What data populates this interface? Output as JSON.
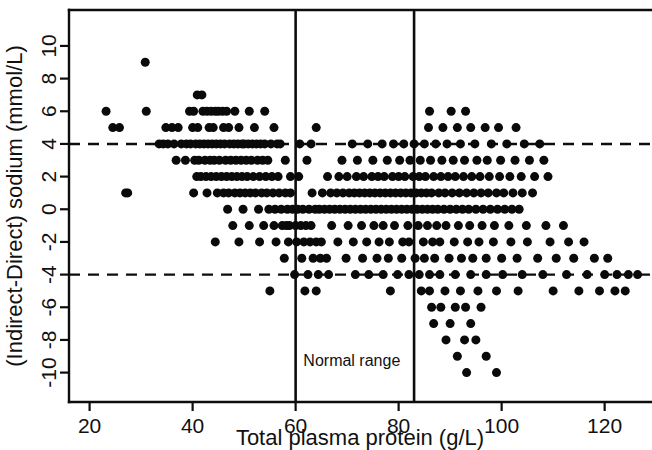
{
  "chart_data": {
    "type": "scatter",
    "title": "",
    "xlabel": "Total plasma protein (g/L)",
    "ylabel": "(Indirect-Direct) sodium (mmol/L)",
    "xlim": [
      16,
      129
    ],
    "ylim": [
      -11.8,
      12.2
    ],
    "xticks": [
      20,
      40,
      60,
      80,
      100,
      120
    ],
    "xtick_labels": [
      "20",
      "40",
      "60",
      "80",
      "100",
      "120"
    ],
    "yticks": [
      -10,
      -8,
      -6,
      -4,
      -2,
      0,
      2,
      4,
      6,
      8,
      10
    ],
    "ytick_labels": [
      "-10",
      "-8",
      "-6",
      "-4",
      "-2",
      "0",
      "2",
      "4",
      "6",
      "8",
      "10"
    ],
    "grid": false,
    "legend": "none",
    "marker": "filled-circle",
    "marker_color": "#0a0a0a",
    "marker_size_px": 9,
    "reference_lines": [
      {
        "name": "upper-limit-of-agreement",
        "orientation": "horizontal",
        "value": 4,
        "style": "dashed"
      },
      {
        "name": "lower-limit-of-agreement",
        "orientation": "horizontal",
        "value": -4,
        "style": "dashed"
      }
    ],
    "range_markers": [
      {
        "name": "normal-range-lower",
        "orientation": "vertical",
        "value": 60,
        "style": "solid"
      },
      {
        "name": "normal-range-upper",
        "orientation": "vertical",
        "value": 83,
        "style": "solid"
      }
    ],
    "annotations": [
      {
        "text": "Normal range",
        "x": 61.5,
        "y": -9.6
      }
    ],
    "points": [
      [
        23.2,
        6
      ],
      [
        24.5,
        5
      ],
      [
        25.8,
        5
      ],
      [
        27.0,
        1
      ],
      [
        30.8,
        9
      ],
      [
        31.0,
        6
      ],
      [
        33.5,
        4
      ],
      [
        34.3,
        4
      ],
      [
        34.8,
        5
      ],
      [
        36.0,
        5
      ],
      [
        37.2,
        5
      ],
      [
        35.2,
        4
      ],
      [
        36.4,
        4
      ],
      [
        37.8,
        4
      ],
      [
        38.8,
        4
      ],
      [
        39.4,
        6
      ],
      [
        40.2,
        6
      ],
      [
        40.9,
        7
      ],
      [
        41.8,
        7
      ],
      [
        40.0,
        5
      ],
      [
        41.0,
        5
      ],
      [
        39.6,
        4
      ],
      [
        40.6,
        4
      ],
      [
        41.4,
        4
      ],
      [
        42.2,
        4
      ],
      [
        43.0,
        4
      ],
      [
        42.0,
        6
      ],
      [
        42.8,
        6
      ],
      [
        43.6,
        6
      ],
      [
        44.4,
        6
      ],
      [
        43.2,
        5
      ],
      [
        44.0,
        5
      ],
      [
        43.8,
        4
      ],
      [
        44.6,
        4
      ],
      [
        45.4,
        4
      ],
      [
        46.2,
        4
      ],
      [
        45.0,
        6
      ],
      [
        45.8,
        6
      ],
      [
        46.6,
        6
      ],
      [
        46.0,
        5
      ],
      [
        47.0,
        5
      ],
      [
        47.2,
        4
      ],
      [
        48.0,
        4
      ],
      [
        48.8,
        4
      ],
      [
        49.6,
        4
      ],
      [
        48.2,
        6
      ],
      [
        49.0,
        5
      ],
      [
        50.0,
        4
      ],
      [
        50.8,
        4
      ],
      [
        51.6,
        4
      ],
      [
        52.4,
        4
      ],
      [
        51.0,
        6
      ],
      [
        52.0,
        5
      ],
      [
        53.2,
        4
      ],
      [
        54.0,
        4
      ],
      [
        55.2,
        4
      ],
      [
        56.4,
        4
      ],
      [
        38.6,
        3
      ],
      [
        40.4,
        3
      ],
      [
        41.2,
        3
      ],
      [
        42.4,
        3
      ],
      [
        43.4,
        3
      ],
      [
        44.2,
        3
      ],
      [
        45.2,
        3
      ],
      [
        46.4,
        3
      ],
      [
        47.4,
        3
      ],
      [
        48.4,
        3
      ],
      [
        49.4,
        3
      ],
      [
        50.4,
        3
      ],
      [
        51.4,
        3
      ],
      [
        52.6,
        3
      ],
      [
        53.6,
        3
      ],
      [
        54.6,
        3
      ],
      [
        36.8,
        3
      ],
      [
        40.8,
        2
      ],
      [
        41.6,
        2
      ],
      [
        42.6,
        2
      ],
      [
        43.6,
        2
      ],
      [
        44.6,
        2
      ],
      [
        45.6,
        2
      ],
      [
        46.6,
        2
      ],
      [
        47.6,
        2
      ],
      [
        48.6,
        2
      ],
      [
        49.6,
        2
      ],
      [
        50.6,
        2
      ],
      [
        51.8,
        2
      ],
      [
        53.0,
        2
      ],
      [
        54.2,
        2
      ],
      [
        55.4,
        2
      ],
      [
        56.6,
        2
      ],
      [
        40.2,
        1
      ],
      [
        42.8,
        1
      ],
      [
        44.8,
        1
      ],
      [
        46.0,
        1
      ],
      [
        47.0,
        1
      ],
      [
        48.2,
        1
      ],
      [
        49.2,
        1
      ],
      [
        50.2,
        1
      ],
      [
        51.2,
        1
      ],
      [
        52.2,
        1
      ],
      [
        53.4,
        1
      ],
      [
        54.4,
        1
      ],
      [
        55.6,
        1
      ],
      [
        56.8,
        1
      ],
      [
        58.0,
        1
      ],
      [
        59.0,
        1
      ],
      [
        27.4,
        1
      ],
      [
        46.8,
        0
      ],
      [
        49.8,
        0
      ],
      [
        52.8,
        0
      ],
      [
        54.8,
        0
      ],
      [
        56.0,
        0
      ],
      [
        57.2,
        0
      ],
      [
        58.4,
        0
      ],
      [
        59.4,
        0
      ],
      [
        60.4,
        0
      ],
      [
        61.4,
        0
      ],
      [
        47.8,
        -1
      ],
      [
        51.0,
        -1
      ],
      [
        53.8,
        -1
      ],
      [
        55.8,
        -1
      ],
      [
        57.4,
        -1
      ],
      [
        58.8,
        -1
      ],
      [
        60.0,
        -1
      ],
      [
        61.0,
        -1
      ],
      [
        62.0,
        -1
      ],
      [
        63.0,
        -1
      ],
      [
        44.4,
        -2
      ],
      [
        49.0,
        -2
      ],
      [
        53.0,
        -2
      ],
      [
        56.2,
        -2
      ],
      [
        58.6,
        -2
      ],
      [
        60.2,
        -2
      ],
      [
        61.6,
        -2
      ],
      [
        62.8,
        -2
      ],
      [
        64.0,
        -2
      ],
      [
        65.0,
        -2
      ],
      [
        57.8,
        -3
      ],
      [
        61.2,
        -3
      ],
      [
        63.4,
        -3
      ],
      [
        64.8,
        -3
      ],
      [
        66.0,
        -3
      ],
      [
        59.8,
        -4
      ],
      [
        62.4,
        -4
      ],
      [
        64.4,
        -4
      ],
      [
        66.4,
        -4
      ],
      [
        55.0,
        -5
      ],
      [
        61.8,
        -5
      ],
      [
        64.0,
        -5
      ],
      [
        58.2,
        -1
      ],
      [
        62.6,
        0
      ],
      [
        63.8,
        0
      ],
      [
        64.6,
        0
      ],
      [
        65.6,
        0
      ],
      [
        66.6,
        0
      ],
      [
        67.6,
        0
      ],
      [
        68.6,
        0
      ],
      [
        69.6,
        0
      ],
      [
        70.6,
        0
      ],
      [
        71.6,
        0
      ],
      [
        72.6,
        0
      ],
      [
        73.6,
        0
      ],
      [
        74.6,
        0
      ],
      [
        75.6,
        0
      ],
      [
        76.6,
        0
      ],
      [
        77.6,
        0
      ],
      [
        78.6,
        0
      ],
      [
        79.6,
        0
      ],
      [
        80.6,
        0
      ],
      [
        81.6,
        0
      ],
      [
        82.6,
        0
      ],
      [
        83.6,
        0
      ],
      [
        84.6,
        0
      ],
      [
        85.6,
        0
      ],
      [
        86.6,
        0
      ],
      [
        87.6,
        0
      ],
      [
        88.8,
        0
      ],
      [
        90.0,
        0
      ],
      [
        91.2,
        0
      ],
      [
        92.4,
        0
      ],
      [
        93.6,
        0
      ],
      [
        95.0,
        0
      ],
      [
        96.4,
        0
      ],
      [
        97.8,
        0
      ],
      [
        99.2,
        0
      ],
      [
        100.6,
        0
      ],
      [
        102.0,
        0
      ],
      [
        103.4,
        0
      ],
      [
        63.2,
        1
      ],
      [
        65.2,
        1
      ],
      [
        66.8,
        1
      ],
      [
        68.0,
        1
      ],
      [
        69.2,
        1
      ],
      [
        70.4,
        1
      ],
      [
        71.4,
        1
      ],
      [
        72.4,
        1
      ],
      [
        73.4,
        1
      ],
      [
        74.4,
        1
      ],
      [
        75.4,
        1
      ],
      [
        76.4,
        1
      ],
      [
        77.4,
        1
      ],
      [
        78.4,
        1
      ],
      [
        79.4,
        1
      ],
      [
        80.4,
        1
      ],
      [
        81.4,
        1
      ],
      [
        82.4,
        1
      ],
      [
        83.4,
        1
      ],
      [
        84.4,
        1
      ],
      [
        85.4,
        1
      ],
      [
        86.4,
        1
      ],
      [
        87.8,
        1
      ],
      [
        89.0,
        1
      ],
      [
        90.4,
        1
      ],
      [
        91.8,
        1
      ],
      [
        93.2,
        1
      ],
      [
        94.6,
        1
      ],
      [
        96.0,
        1
      ],
      [
        97.4,
        1
      ],
      [
        99.0,
        1
      ],
      [
        100.4,
        1
      ],
      [
        102.2,
        1
      ],
      [
        104.0,
        1
      ],
      [
        106.0,
        1
      ],
      [
        66.2,
        2
      ],
      [
        68.4,
        2
      ],
      [
        70.0,
        2
      ],
      [
        71.8,
        2
      ],
      [
        73.2,
        2
      ],
      [
        74.8,
        2
      ],
      [
        76.0,
        2
      ],
      [
        77.2,
        2
      ],
      [
        78.8,
        2
      ],
      [
        80.0,
        2
      ],
      [
        81.2,
        2
      ],
      [
        82.8,
        2
      ],
      [
        84.0,
        2
      ],
      [
        85.2,
        2
      ],
      [
        86.8,
        2
      ],
      [
        88.2,
        2
      ],
      [
        89.6,
        2
      ],
      [
        91.0,
        2
      ],
      [
        92.6,
        2
      ],
      [
        94.2,
        2
      ],
      [
        95.8,
        2
      ],
      [
        97.6,
        2
      ],
      [
        99.6,
        2
      ],
      [
        101.6,
        2
      ],
      [
        103.8,
        2
      ],
      [
        106.4,
        2
      ],
      [
        109.0,
        2
      ],
      [
        69.0,
        3
      ],
      [
        72.0,
        3
      ],
      [
        75.0,
        3
      ],
      [
        77.8,
        3
      ],
      [
        80.2,
        3
      ],
      [
        82.2,
        3
      ],
      [
        84.2,
        3
      ],
      [
        86.2,
        3
      ],
      [
        88.4,
        3
      ],
      [
        90.6,
        3
      ],
      [
        92.8,
        3
      ],
      [
        95.2,
        3
      ],
      [
        97.2,
        3
      ],
      [
        99.8,
        3
      ],
      [
        102.6,
        3
      ],
      [
        105.4,
        3
      ],
      [
        108.2,
        3
      ],
      [
        71.0,
        4
      ],
      [
        74.0,
        4
      ],
      [
        76.8,
        4
      ],
      [
        79.0,
        4
      ],
      [
        81.0,
        4
      ],
      [
        83.0,
        4
      ],
      [
        85.0,
        4
      ],
      [
        87.2,
        4
      ],
      [
        89.4,
        4
      ],
      [
        92.0,
        4
      ],
      [
        94.8,
        4
      ],
      [
        98.0,
        4
      ],
      [
        101.0,
        4
      ],
      [
        104.4,
        4
      ],
      [
        107.4,
        4
      ],
      [
        85.8,
        5
      ],
      [
        88.6,
        5
      ],
      [
        91.4,
        5
      ],
      [
        94.0,
        5
      ],
      [
        96.8,
        5
      ],
      [
        99.4,
        5
      ],
      [
        102.8,
        5
      ],
      [
        64.0,
        5
      ],
      [
        86.0,
        6
      ],
      [
        90.2,
        6
      ],
      [
        93.0,
        6
      ],
      [
        67.0,
        -1
      ],
      [
        70.2,
        -1
      ],
      [
        72.8,
        -1
      ],
      [
        75.2,
        -1
      ],
      [
        77.0,
        -1
      ],
      [
        79.2,
        -1
      ],
      [
        81.8,
        -1
      ],
      [
        83.8,
        -1
      ],
      [
        85.6,
        -1
      ],
      [
        87.4,
        -1
      ],
      [
        89.2,
        -1
      ],
      [
        91.6,
        -1
      ],
      [
        93.8,
        -1
      ],
      [
        96.2,
        -1
      ],
      [
        98.6,
        -1
      ],
      [
        101.4,
        -1
      ],
      [
        104.8,
        -1
      ],
      [
        108.6,
        -1
      ],
      [
        112.0,
        -1
      ],
      [
        68.2,
        -2
      ],
      [
        71.2,
        -2
      ],
      [
        73.8,
        -2
      ],
      [
        76.2,
        -2
      ],
      [
        78.2,
        -2
      ],
      [
        80.8,
        -2
      ],
      [
        82.0,
        -2
      ],
      [
        84.8,
        -2
      ],
      [
        86.6,
        -2
      ],
      [
        88.0,
        -2
      ],
      [
        90.8,
        -2
      ],
      [
        93.4,
        -2
      ],
      [
        95.6,
        -2
      ],
      [
        98.4,
        -2
      ],
      [
        101.8,
        -2
      ],
      [
        105.0,
        -2
      ],
      [
        109.4,
        -2
      ],
      [
        113.0,
        -2
      ],
      [
        116.0,
        -2
      ],
      [
        69.8,
        -3
      ],
      [
        73.0,
        -3
      ],
      [
        75.8,
        -3
      ],
      [
        78.0,
        -3
      ],
      [
        80.6,
        -3
      ],
      [
        83.2,
        -3
      ],
      [
        85.0,
        -3
      ],
      [
        87.0,
        -3
      ],
      [
        89.8,
        -3
      ],
      [
        92.2,
        -3
      ],
      [
        94.4,
        -3
      ],
      [
        97.0,
        -3
      ],
      [
        100.0,
        -3
      ],
      [
        103.0,
        -3
      ],
      [
        107.0,
        -3
      ],
      [
        110.6,
        -3
      ],
      [
        114.0,
        -3
      ],
      [
        118.0,
        -3
      ],
      [
        120.6,
        -3
      ],
      [
        71.6,
        -4
      ],
      [
        74.2,
        -4
      ],
      [
        77.0,
        -4
      ],
      [
        79.8,
        -4
      ],
      [
        82.0,
        -4
      ],
      [
        84.0,
        -4
      ],
      [
        86.0,
        -4
      ],
      [
        88.0,
        -4
      ],
      [
        91.0,
        -4
      ],
      [
        94.0,
        -4
      ],
      [
        97.0,
        -4
      ],
      [
        100.2,
        -4
      ],
      [
        104.0,
        -4
      ],
      [
        108.0,
        -4
      ],
      [
        112.6,
        -4
      ],
      [
        116.6,
        -4
      ],
      [
        120.0,
        -4
      ],
      [
        122.4,
        -4
      ],
      [
        124.6,
        -4
      ],
      [
        126.4,
        -4
      ],
      [
        78.4,
        -5
      ],
      [
        84.4,
        -5
      ],
      [
        86.0,
        -5
      ],
      [
        89.0,
        -5
      ],
      [
        92.0,
        -5
      ],
      [
        95.4,
        -5
      ],
      [
        99.0,
        -5
      ],
      [
        103.2,
        -5
      ],
      [
        110.0,
        -5
      ],
      [
        115.0,
        -5
      ],
      [
        119.0,
        -5
      ],
      [
        122.0,
        -5
      ],
      [
        124.0,
        -5
      ],
      [
        86.4,
        -6
      ],
      [
        88.2,
        -6
      ],
      [
        91.0,
        -6
      ],
      [
        93.0,
        -6
      ],
      [
        96.0,
        -6
      ],
      [
        86.8,
        -7
      ],
      [
        90.0,
        -7
      ],
      [
        94.0,
        -7
      ],
      [
        89.2,
        -8
      ],
      [
        92.8,
        -8
      ],
      [
        95.0,
        -8
      ],
      [
        91.4,
        -9
      ],
      [
        97.0,
        -9
      ],
      [
        93.2,
        -10
      ],
      [
        99.0,
        -10
      ],
      [
        59.0,
        2
      ],
      [
        60.6,
        2
      ],
      [
        62.2,
        3
      ],
      [
        60.8,
        4
      ],
      [
        63.0,
        4
      ],
      [
        58.0,
        3
      ],
      [
        57.0,
        4
      ],
      [
        55.8,
        5
      ],
      [
        54.0,
        6
      ]
    ]
  }
}
